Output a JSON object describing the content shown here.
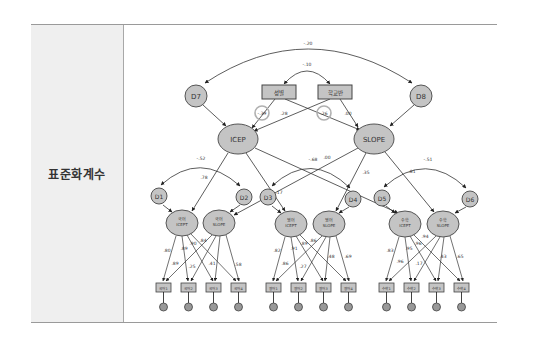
{
  "table": {
    "row_label": "표준화계수"
  },
  "diagram": {
    "colors": {
      "node_fill": "#c4c4c4",
      "node_stroke": "#555555",
      "line": "#333333",
      "highlight_circle": "#b8b8b8"
    },
    "covariances": {
      "D7_D8": "-.20",
      "gender_school": "-.10",
      "D1_D2": "-.52",
      "D3_D4": "-.68",
      "D5_D6": "-.51"
    },
    "nodes": {
      "D7": "D7",
      "D8": "D8",
      "gender": "성별",
      "school": "학교반",
      "ICEP": "ICEP",
      "SLOPE": "SLOPE",
      "D1": "D1",
      "D2": "D2",
      "D3": "D3",
      "D4": "D4",
      "D5": "D5",
      "D6": "D6",
      "kor_icept_1": "국어",
      "kor_icept_2": "ICEPT",
      "kor_slope_1": "국어",
      "kor_slope_2": "SLOPE",
      "eng_icept_1": "영어",
      "eng_icept_2": "ICEPT",
      "eng_slope_1": "영어",
      "eng_slope_2": "SLOPE",
      "math_icept_1": "수학",
      "math_icept_2": "ICEPT",
      "math_slope_1": "수학",
      "math_slope_2": "SLOPE"
    },
    "indicators": [
      "국어1",
      "국어2",
      "국어3",
      "국어4",
      "영어1",
      "영어2",
      "영어3",
      "영어4",
      "수학1",
      "수학2",
      "수학3",
      "수학4"
    ],
    "errors": [
      "e1",
      "e2",
      "e3",
      "e4",
      "e5",
      "e6",
      "e7",
      "e8",
      "e9",
      "e10",
      "e11",
      "e12"
    ],
    "paths": {
      "gender_ICEP": "-.39",
      "gender_SLOPE": ".28",
      "school_ICEP": ".26",
      "school_SLOPE": ".00",
      "ICEP_kor": ".78",
      "SLOPE_eng": ".00",
      "SLOPE_eng2": ".35",
      "ICEP_eng": ".17",
      "SLOPE_math": ".81"
    },
    "loadings": {
      "kor": [
        ".80",
        ".89",
        ".90",
        ".84",
        ".89",
        ".25",
        ".41",
        ".58"
      ],
      "eng": [
        ".82",
        ".91",
        ".89",
        ".86",
        ".86",
        ".27",
        ".48",
        ".69"
      ],
      "math": [
        ".83",
        ".95",
        ".96",
        ".94",
        ".96",
        ".17",
        ".43",
        ".65"
      ]
    }
  }
}
